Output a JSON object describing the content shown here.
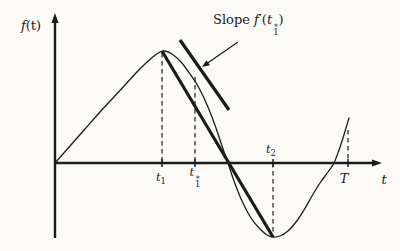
{
  "figure": {
    "background": "#fbfaf7",
    "ink": "#1b1b1b",
    "width": 400,
    "height": 251
  },
  "labels": {
    "y_axis_f": "f",
    "y_axis_args": "(t)",
    "x_axis": "t",
    "slope": {
      "before": "Slope ",
      "f": "f",
      "prime": "′",
      "paren_open": "(",
      "base": "t",
      "sup": "∗",
      "sub": "1",
      "paren_close": ")"
    },
    "t1": {
      "base": "t",
      "sub": "1"
    },
    "t1star": {
      "base": "t",
      "sub": "1",
      "sup": "∗"
    },
    "t2": {
      "base": "t",
      "sub": "2"
    },
    "T": "T"
  },
  "geometry": {
    "axes": {
      "origin": [
        55,
        163
      ],
      "x_end": [
        382,
        163
      ],
      "y_top": [
        55,
        13
      ],
      "y_bottom": [
        55,
        238
      ]
    },
    "curve": [
      [
        55,
        163
      ],
      [
        70,
        146
      ],
      [
        85,
        129
      ],
      [
        100,
        112
      ],
      [
        113,
        98
      ],
      [
        125,
        85
      ],
      [
        136,
        73
      ],
      [
        146,
        63
      ],
      [
        154,
        56
      ],
      [
        160,
        52
      ],
      [
        165,
        51
      ],
      [
        172,
        54
      ],
      [
        181,
        62
      ],
      [
        190,
        74
      ],
      [
        199,
        88
      ],
      [
        208,
        107
      ],
      [
        216,
        128
      ],
      [
        222,
        146
      ],
      [
        228,
        163
      ],
      [
        234,
        181
      ],
      [
        242,
        201
      ],
      [
        251,
        218
      ],
      [
        260,
        229
      ],
      [
        267,
        235
      ],
      [
        273,
        237
      ],
      [
        280,
        236
      ],
      [
        288,
        231
      ],
      [
        296,
        222
      ],
      [
        304,
        210
      ],
      [
        312,
        196
      ],
      [
        320,
        183
      ],
      [
        328,
        172
      ],
      [
        334,
        163
      ],
      [
        339,
        150
      ],
      [
        343,
        138
      ],
      [
        346,
        128
      ],
      [
        349,
        118
      ]
    ],
    "chord": {
      "from": [
        162,
        51
      ],
      "to": [
        273,
        237
      ]
    },
    "tangent": {
      "from": [
        180,
        40
      ],
      "to": [
        229,
        110
      ]
    },
    "pointer_arrow": {
      "from": [
        238,
        42
      ],
      "to": [
        202,
        67
      ]
    },
    "dashes": [
      {
        "name": "t1",
        "x": 162,
        "y1": 53,
        "y2": 163
      },
      {
        "name": "t1star",
        "x": 195,
        "y1": 77,
        "y2": 163
      },
      {
        "name": "t2",
        "x": 273,
        "y1": 163,
        "y2": 236
      },
      {
        "name": "T",
        "x": 348,
        "y1": 130,
        "y2": 163
      }
    ],
    "ticks": [
      162,
      195,
      273,
      348
    ],
    "tick_half_len": 4,
    "stroke": {
      "axis": 2.4,
      "curve": 1.3,
      "thick": 3.2,
      "dash": 1.2,
      "tick": 1.5
    },
    "dash_pattern": "4.5 3.5"
  }
}
